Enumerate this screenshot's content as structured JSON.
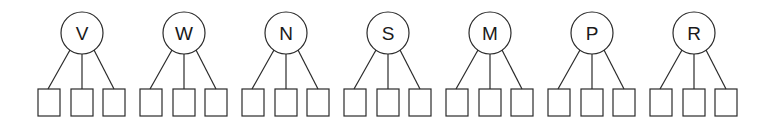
{
  "diagram": {
    "type": "tree-groups",
    "stroke_color": "#2a2a2a",
    "background": "#ffffff",
    "groups": [
      {
        "label": "V",
        "children": 3
      },
      {
        "label": "W",
        "children": 3
      },
      {
        "label": "N",
        "children": 3
      },
      {
        "label": "S",
        "children": 3
      },
      {
        "label": "M",
        "children": 3
      },
      {
        "label": "P",
        "children": 3
      },
      {
        "label": "R",
        "children": 3
      }
    ]
  }
}
